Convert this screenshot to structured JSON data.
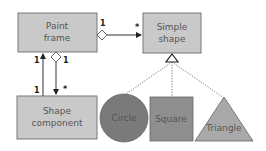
{
  "diagram": {
    "type": "UML class diagram (composite pattern)",
    "colors": {
      "box_fill": "#c9c9c9",
      "box_stroke": "#777777",
      "circle_fill": "#7a7a7a",
      "square_fill": "#8f8f8f",
      "triangle_fill": "#a9a9a9",
      "text": "#555555",
      "line": "#333333"
    },
    "nodes": {
      "paint_frame": {
        "line1": "Paint",
        "line2": "frame"
      },
      "simple_shape": {
        "line1": "Simple",
        "line2": "shape"
      },
      "shape_component": {
        "line1": "Shape",
        "line2": "component"
      },
      "circle": {
        "label": "Circle"
      },
      "square": {
        "label": "Square"
      },
      "triangle": {
        "label": "Triangle"
      }
    },
    "edges": {
      "frame_to_simple": {
        "source_mult": "1",
        "target_mult": "*"
      },
      "component_to_frame": {
        "source_mult": "1",
        "target_mult": "1"
      },
      "frame_to_component": {
        "source_mult": "1",
        "target_mult": "*"
      }
    }
  }
}
